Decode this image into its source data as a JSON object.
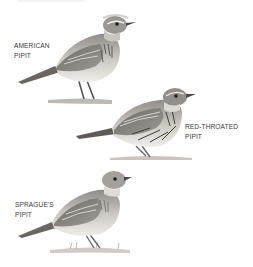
{
  "plate": {
    "birds": [
      {
        "id": "american-pipit",
        "label_line1": "AMERICAN",
        "label_line2": "PIPIT"
      },
      {
        "id": "red-throated-pipit",
        "label_line1": "RED-THROATED",
        "label_line2": "PIPIT"
      },
      {
        "id": "spragues-pipit",
        "label_line1": "SPRAGUE'S",
        "label_line2": "PIPIT"
      }
    ],
    "colors": {
      "background": "#ffffff",
      "ink": "#3a3a3a",
      "body_light": "#e8e6e2",
      "body_mid": "#a9a6a0",
      "streak": "#4a4845"
    }
  }
}
